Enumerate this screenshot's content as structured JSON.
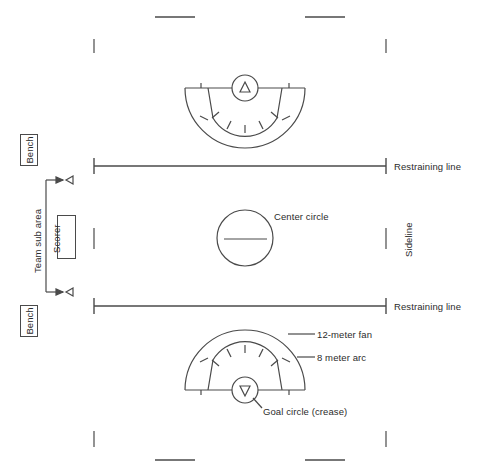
{
  "diagram": {
    "line_color": "#4a4a4a",
    "text_color": "#2b2b2b",
    "background": "#ffffff"
  },
  "labels": {
    "bench_top": "Bench",
    "bench_bottom": "Bench",
    "team_sub_area": "Team sub area",
    "scorer": "Scorer",
    "restraining_line_top": "Restraining line",
    "restraining_line_bottom": "Restraining line",
    "sideline": "Sideline",
    "center_circle": "Center circle",
    "twelve_meter_fan": "12-meter fan",
    "eight_meter_arc": "8 meter arc",
    "goal_circle": "Goal circle (crease)"
  },
  "markings": {
    "center_circle_radius": 28,
    "goal_circle_radius": 13,
    "twelve_meter_fan_radius": 60,
    "eight_meter_arc_radius": 37,
    "restraining_line_y_top": 166,
    "restraining_line_y_bottom": 306,
    "field_left_x": 94,
    "field_right_x": 386,
    "center_x": 245,
    "center_y": 238
  }
}
